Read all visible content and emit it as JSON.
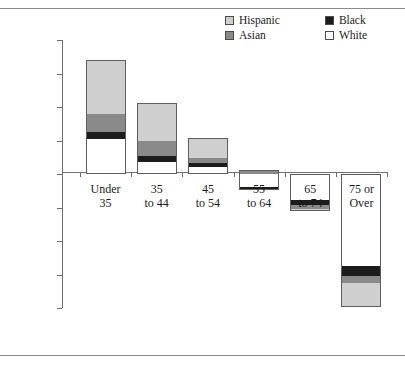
{
  "chart_data": {
    "type": "bar",
    "subtype": "stacked-diverging",
    "title": "",
    "xlabel": "",
    "ylabel": "",
    "categories": [
      "Under 35",
      "35 to 44",
      "45 to 54",
      "55 to 64",
      "65 to 74",
      "75 or Over"
    ],
    "category_lines": [
      [
        "Under",
        "35"
      ],
      [
        "35",
        "to 44"
      ],
      [
        "45",
        "to 54"
      ],
      [
        "55",
        "to 64"
      ],
      [
        "65",
        "to 74"
      ],
      [
        "75 or",
        "Over"
      ]
    ],
    "ylim": [
      -120000,
      120000
    ],
    "yticks": [
      120000,
      90000,
      60000,
      30000,
      0,
      -30000,
      -60000,
      -90000,
      -120000
    ],
    "ytick_labels": [
      "120,000",
      "90,000",
      "60,000",
      "30,000",
      "0",
      "-30,000",
      "-60,000",
      "-90,000",
      "-120,000"
    ],
    "grid": false,
    "legend_position": "top-right",
    "series": [
      {
        "name": "Hispanic",
        "color": "#cfcfcf",
        "values": [
          48000,
          34000,
          18000,
          0,
          -2500,
          -22000
        ]
      },
      {
        "name": "Asian",
        "color": "#8a8a8a",
        "values": [
          16000,
          13000,
          4500,
          4000,
          -3500,
          -6500
        ]
      },
      {
        "name": "Black",
        "color": "#1c1c1c",
        "values": [
          7000,
          5500,
          3500,
          -2500,
          -4500,
          -9000
        ]
      },
      {
        "name": "White",
        "color": "#ffffff",
        "values": [
          31000,
          11000,
          6000,
          -12000,
          -23000,
          -82000
        ]
      }
    ],
    "stack_order_positive": [
      "White",
      "Black",
      "Asian",
      "Hispanic"
    ],
    "stack_order_negative": [
      "White",
      "Black",
      "Asian",
      "Hispanic"
    ],
    "totals": [
      102000,
      63500,
      32000,
      -11000,
      -33500,
      -119500
    ]
  },
  "legend": {
    "entries": [
      {
        "label": "Hispanic",
        "color": "#cfcfcf"
      },
      {
        "label": "Black",
        "color": "#1c1c1c"
      },
      {
        "label": "Asian",
        "color": "#8a8a8a"
      },
      {
        "label": "White",
        "color": "#ffffff"
      }
    ]
  },
  "colors": {
    "axis": "#6f6f6f",
    "rule": "#8d8d8d",
    "text": "#1a1a1a",
    "background": "#ffffff"
  }
}
